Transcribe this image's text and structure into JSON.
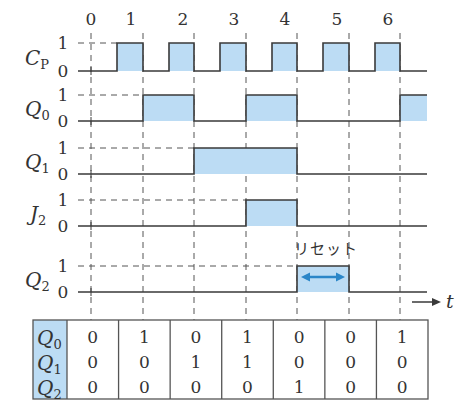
{
  "diagram": {
    "type": "timing-diagram",
    "clock_labels": [
      "0",
      "1",
      "2",
      "3",
      "4",
      "5",
      "6"
    ],
    "level_high_label": "1",
    "level_low_label": "0",
    "time_axis_label": "t",
    "reset_label": "リセット",
    "colors": {
      "fill": "#bcdcf4",
      "line": "#3a3a3a",
      "grid": "#555555",
      "arrow": "#2b86c8",
      "table_header_fill": "#bcdcf4"
    },
    "signals": [
      {
        "id": "CP",
        "name": "C",
        "sub": "P",
        "high_y": 43,
        "low_y": 71,
        "segments": [
          [
            117,
            143
          ],
          [
            169,
            194
          ],
          [
            220,
            246
          ],
          [
            272,
            297
          ],
          [
            323,
            349
          ],
          [
            375,
            400
          ]
        ]
      },
      {
        "id": "Q0",
        "name": "Q",
        "sub": "0",
        "high_y": 95,
        "low_y": 121,
        "segments": [
          [
            143,
            194
          ],
          [
            246,
            297
          ],
          [
            400,
            427
          ]
        ]
      },
      {
        "id": "Q1",
        "name": "Q",
        "sub": "1",
        "high_y": 148,
        "low_y": 174,
        "segments": [
          [
            194,
            297
          ]
        ]
      },
      {
        "id": "J2",
        "name": "J",
        "sub": "2",
        "high_y": 200,
        "low_y": 226,
        "segments": [
          [
            246,
            297
          ]
        ]
      },
      {
        "id": "Q2",
        "name": "Q",
        "sub": "2",
        "high_y": 266,
        "low_y": 292,
        "segments": [
          [
            297,
            349
          ]
        ]
      }
    ],
    "gridlines_x": [
      91,
      143,
      194,
      246,
      297,
      349,
      400
    ],
    "clock_label_x": [
      91,
      131,
      183,
      234,
      285,
      337,
      388
    ]
  },
  "table": {
    "row_headers": [
      {
        "name": "Q",
        "sub": "0"
      },
      {
        "name": "Q",
        "sub": "1"
      },
      {
        "name": "Q",
        "sub": "2"
      }
    ],
    "columns": [
      {
        "t": "0",
        "Q0": "0",
        "Q1": "0",
        "Q2": "0"
      },
      {
        "t": "1",
        "Q0": "1",
        "Q1": "0",
        "Q2": "0"
      },
      {
        "t": "2",
        "Q0": "0",
        "Q1": "1",
        "Q2": "0"
      },
      {
        "t": "3",
        "Q0": "1",
        "Q1": "1",
        "Q2": "0"
      },
      {
        "t": "4",
        "Q0": "0",
        "Q1": "0",
        "Q2": "1"
      },
      {
        "t": "5",
        "Q0": "0",
        "Q1": "0",
        "Q2": "0"
      },
      {
        "t": "6",
        "Q0": "1",
        "Q1": "0",
        "Q2": "0"
      }
    ]
  }
}
